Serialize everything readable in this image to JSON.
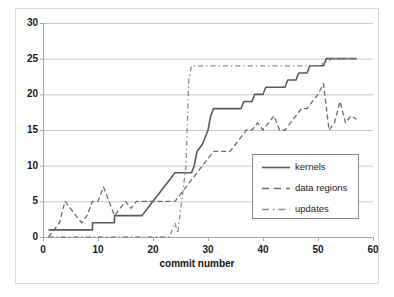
{
  "chart_data": {
    "type": "line",
    "title": "",
    "xlabel": "commit number",
    "ylabel": "",
    "xlim": [
      0,
      60
    ],
    "ylim": [
      0,
      30
    ],
    "grid": true,
    "grid_axis": "y",
    "legend_position": "center-right",
    "x_ticks": [
      "0",
      "10",
      "20",
      "30",
      "40",
      "50",
      "60"
    ],
    "y_ticks": [
      "0",
      "5",
      "10",
      "15",
      "20",
      "25",
      "30"
    ],
    "series": [
      {
        "name": "kernels",
        "style": "solid",
        "color": "#595959",
        "points": [
          [
            1,
            1
          ],
          [
            9,
            1
          ],
          [
            9,
            2
          ],
          [
            13,
            2
          ],
          [
            13,
            3
          ],
          [
            18,
            3
          ],
          [
            19,
            4
          ],
          [
            20,
            5
          ],
          [
            21,
            6
          ],
          [
            22,
            7
          ],
          [
            23,
            8
          ],
          [
            24,
            9
          ],
          [
            27,
            9
          ],
          [
            27.5,
            10
          ],
          [
            28,
            12
          ],
          [
            29,
            13
          ],
          [
            30,
            15
          ],
          [
            30.5,
            17
          ],
          [
            31,
            18
          ],
          [
            36,
            18
          ],
          [
            36.5,
            19
          ],
          [
            38,
            19
          ],
          [
            38.5,
            20
          ],
          [
            40,
            20
          ],
          [
            40.5,
            21
          ],
          [
            44,
            21
          ],
          [
            44.5,
            22
          ],
          [
            46,
            22
          ],
          [
            46.5,
            23
          ],
          [
            48,
            23
          ],
          [
            48.5,
            24
          ],
          [
            50,
            24
          ],
          [
            51,
            24
          ],
          [
            51.5,
            25
          ],
          [
            57,
            25
          ]
        ]
      },
      {
        "name": "data regions",
        "style": "dashed",
        "color": "#6b6b6b",
        "points": [
          [
            1,
            0
          ],
          [
            2,
            1
          ],
          [
            3,
            2
          ],
          [
            4,
            5
          ],
          [
            5,
            4
          ],
          [
            6,
            3
          ],
          [
            7,
            2
          ],
          [
            8,
            3
          ],
          [
            9,
            5
          ],
          [
            10,
            5
          ],
          [
            11,
            7
          ],
          [
            12,
            5
          ],
          [
            13,
            3
          ],
          [
            14,
            4
          ],
          [
            15,
            5
          ],
          [
            16,
            4
          ],
          [
            17,
            5
          ],
          [
            18,
            5
          ],
          [
            19,
            5
          ],
          [
            20,
            5
          ],
          [
            21,
            5
          ],
          [
            22,
            5
          ],
          [
            23,
            5
          ],
          [
            24,
            5
          ],
          [
            25,
            6
          ],
          [
            26,
            7
          ],
          [
            27,
            8
          ],
          [
            28,
            9
          ],
          [
            29,
            10
          ],
          [
            30,
            11
          ],
          [
            31,
            12
          ],
          [
            32,
            12
          ],
          [
            33,
            12
          ],
          [
            34,
            12
          ],
          [
            35,
            13
          ],
          [
            36,
            14
          ],
          [
            37,
            15
          ],
          [
            38,
            15
          ],
          [
            39,
            16
          ],
          [
            40,
            15
          ],
          [
            41,
            16
          ],
          [
            42,
            17
          ],
          [
            43,
            15
          ],
          [
            44,
            15
          ],
          [
            45,
            16
          ],
          [
            46,
            17
          ],
          [
            47,
            18
          ],
          [
            48,
            18
          ],
          [
            49,
            19
          ],
          [
            50,
            20
          ],
          [
            51,
            21.5
          ],
          [
            52,
            15
          ],
          [
            53,
            16
          ],
          [
            54,
            19
          ],
          [
            55,
            16
          ],
          [
            56,
            17
          ],
          [
            57,
            16.5
          ]
        ]
      },
      {
        "name": "updates",
        "style": "dashdot",
        "color": "#8c8c8c",
        "points": [
          [
            1,
            0
          ],
          [
            9,
            0
          ],
          [
            18,
            0
          ],
          [
            23,
            0
          ],
          [
            24,
            2
          ],
          [
            24.5,
            0.5
          ],
          [
            26,
            10
          ],
          [
            26.5,
            22
          ],
          [
            27,
            24
          ],
          [
            30,
            24
          ],
          [
            34,
            24
          ],
          [
            38,
            24
          ],
          [
            41,
            24
          ],
          [
            45,
            24
          ],
          [
            50,
            24
          ],
          [
            53,
            25
          ],
          [
            57,
            25
          ]
        ]
      }
    ]
  },
  "legend": {
    "items": [
      {
        "label": "kernels",
        "style": "solid"
      },
      {
        "label": "data regions",
        "style": "dashed"
      },
      {
        "label": "updates",
        "style": "dashdot"
      }
    ]
  },
  "axes": {
    "x_title": "commit number"
  }
}
